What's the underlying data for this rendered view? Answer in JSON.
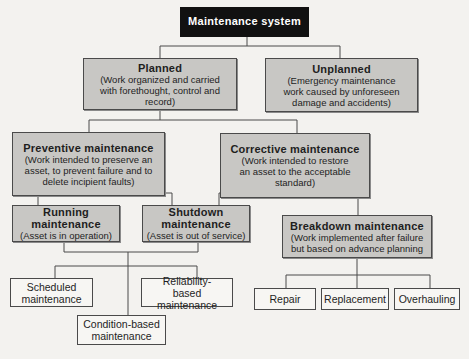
{
  "diagram": {
    "root": {
      "title": "Maintenance system"
    },
    "planned": {
      "title": "Planned",
      "desc": "(Work organized and carried with forethought, control and record)"
    },
    "unplanned": {
      "title": "Unplanned",
      "desc": "(Emergency maintenance work caused by unforeseen damage and accidents)"
    },
    "preventive": {
      "title": "Preventive maintenance",
      "desc": "(Work intended to preserve an asset, to prevent failure and to delete incipient faults)"
    },
    "corrective": {
      "title": "Corrective maintenance",
      "desc": "(Work intended to restore an asset to the acceptable standard)"
    },
    "running": {
      "title": "Running maintenance",
      "desc": "(Asset is in operation)"
    },
    "shutdown": {
      "title": "Shutdown maintenance",
      "desc": "(Asset is out of service)"
    },
    "breakdown": {
      "title": "Breakdown maintenance",
      "desc": "(Work implemented after failure but based on advance planning"
    },
    "scheduled": {
      "title": "Scheduled maintenance"
    },
    "reliability": {
      "title": "Reliability-based maintenance"
    },
    "condition": {
      "title": "Condition-based maintenance"
    },
    "repair": {
      "title": "Repair"
    },
    "replacement": {
      "title": "Replacement"
    },
    "overhauling": {
      "title": "Overhauling"
    }
  },
  "colors": {
    "root_fill": "#111111",
    "category_fill": "#c8c7c4",
    "leaf_fill": "#f7f6f3",
    "line": "#4a4a4a"
  }
}
